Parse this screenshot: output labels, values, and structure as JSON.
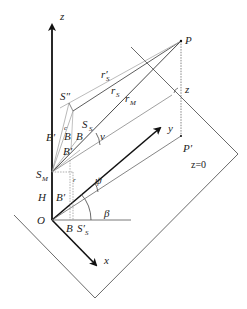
{
  "figure": {
    "type": "3d-geometry-diagram",
    "colors": {
      "axis": "#111111",
      "line": "#333333",
      "light_line": "#aaaaaa",
      "dotted": "#666666",
      "text": "#222222"
    },
    "labels": {
      "z_axis": "z",
      "x_axis": "x",
      "y_axis": "y",
      "origin": "O",
      "height": "H",
      "point_P": "P",
      "point_P_prime": "P′",
      "point_S_double_prime": "S″",
      "point_S_S": "S",
      "point_S_S_sub": "S",
      "point_S_M": "S",
      "point_S_M_sub": "M",
      "r_S_prime": "r′",
      "r_S_prime_sub": "S",
      "r_S": "r",
      "r_S_sub": "S",
      "r_M": "r",
      "r_M_sub": "M",
      "angle_nu": "ν",
      "angle_psi": "ψ",
      "angle_beta": "β",
      "z_at_P": "z",
      "plane": "z=0",
      "B_prime_upper": "B′",
      "B_upper": "B",
      "B_right": "B",
      "B_prime_mid": "B′",
      "B_prime_lower": "B′",
      "B_bottom": "B",
      "S_S_prime_bottom": "S′",
      "S_S_prime_bottom_sub": "S",
      "small_c_label": "c",
      "small_r_label": "r"
    }
  }
}
